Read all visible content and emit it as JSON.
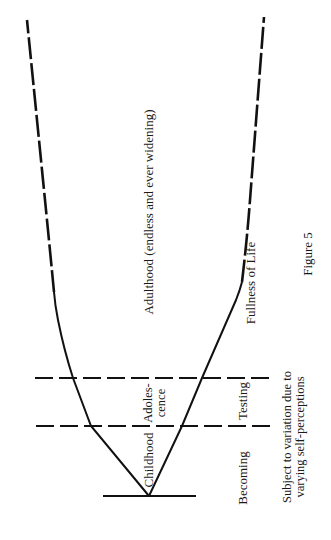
{
  "figure": {
    "caption": "Figure 5",
    "colors": {
      "ink": "#111111",
      "background": "#ffffff"
    }
  },
  "labels": {
    "adulthood": "Adulthood (endless and ever widening)",
    "fullness": "Fullness of Life",
    "childhood": "Childhood",
    "adolescence_line1": "Adoles-",
    "adolescence_line2": "cence",
    "becoming": "Becoming",
    "testing": "Testing",
    "variation_line1": "Subject to variation due to",
    "variation_line2": "varying self-perceptions"
  },
  "stages": [
    {
      "name": "Childhood",
      "process": "Becoming"
    },
    {
      "name": "Adolescence",
      "process": "Testing"
    },
    {
      "name": "Adulthood (endless and ever widening)",
      "process": "Fullness of Life"
    }
  ]
}
